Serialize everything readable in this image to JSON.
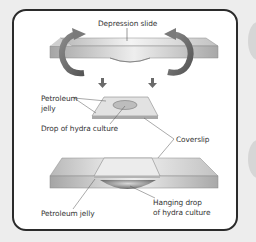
{
  "diagram": {
    "type": "scientific-procedure-illustration",
    "labels": {
      "depression_slide": "Depression slide",
      "petroleum_jelly_top_line1": "Petroleum",
      "petroleum_jelly_top_line2": "jelly",
      "drop_of_hydra_culture": "Drop of hydra culture",
      "coverslip": "Coverslip",
      "petroleum_jelly_bottom": "Petroleum jelly",
      "hanging_drop_line1": "Hanging drop",
      "hanging_drop_line2": "of hydra culture"
    },
    "steps": [
      {
        "name": "flip-depression-slide",
        "description": "Depression slide with curved arrows indicating flipping"
      },
      {
        "name": "coverslip-with-drop",
        "description": "Coverslip with petroleum jelly and a drop of hydra culture"
      },
      {
        "name": "assembled-hanging-drop",
        "description": "Slide placed over coverslip forming a hanging drop"
      }
    ],
    "colors": {
      "frame_border": "#2b2b2b",
      "background": "#ededed",
      "panel": "#ffffff",
      "arrow": "#6e6e6e",
      "slide_light": "#e6e6e6",
      "slide_dark": "#9a9a9a"
    }
  }
}
